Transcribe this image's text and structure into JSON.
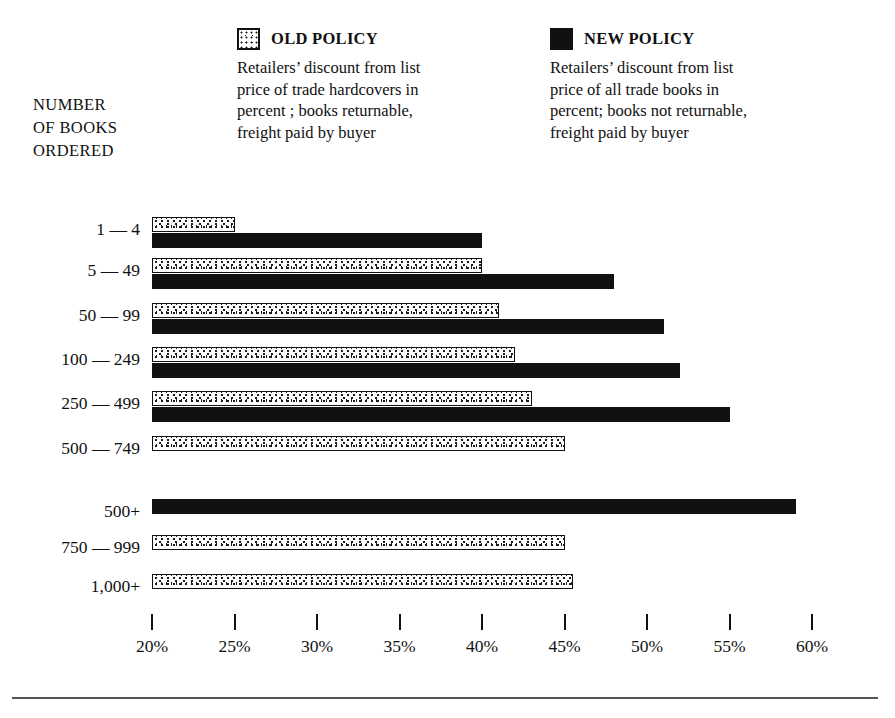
{
  "legend": {
    "old": {
      "swatch": "stipple-square-icon",
      "title": "OLD POLICY",
      "description": "Retailers’ discount from list price of trade hardcovers in percent ; books returnable, freight paid by buyer"
    },
    "new": {
      "swatch": "solid-black-square-icon",
      "title": "NEW POLICY",
      "description": "Retailers’ discount from list price of all trade books in percent; books not returnable, freight paid by buyer"
    }
  },
  "axis": {
    "y_caption_lines": [
      "NUMBER",
      "OF BOOKS",
      "ORDERED"
    ],
    "x_tick_labels": [
      "20%",
      "25%",
      "30%",
      "35%",
      "40%",
      "45%",
      "50%",
      "55%",
      "60%"
    ]
  },
  "colors": {
    "ink": "#111111",
    "paper": "#ffffff",
    "rule": "#555555"
  },
  "chart_data": {
    "type": "bar",
    "orientation": "horizontal",
    "title": "",
    "xlabel": "",
    "ylabel": "NUMBER OF BOOKS ORDERED",
    "xlim": [
      20,
      60
    ],
    "xticks": [
      20,
      25,
      30,
      35,
      40,
      45,
      50,
      55,
      60
    ],
    "grid": false,
    "legend_position": "top",
    "categories": [
      "1 —  4",
      "5 — 49",
      "50 — 99",
      "100 — 249",
      "250 — 499",
      "500 — 749",
      "500+",
      "750 — 999",
      "1,000+"
    ],
    "series": [
      {
        "name": "OLD POLICY",
        "values": [
          25,
          40,
          41,
          42,
          43,
          45,
          null,
          45,
          45.5
        ]
      },
      {
        "name": "NEW POLICY",
        "values": [
          40,
          48,
          51,
          52,
          55,
          null,
          59,
          null,
          null
        ]
      }
    ],
    "groups": [
      {
        "name": "paired-rows",
        "categories": [
          "1 —  4",
          "5 — 49",
          "50 — 99",
          "100 — 249",
          "250 — 499",
          "500 — 749"
        ]
      },
      {
        "name": "single-rows",
        "categories": [
          "500+",
          "750 — 999",
          "1,000+"
        ]
      }
    ]
  },
  "rows": [
    {
      "label": "1 —  4",
      "old": 25,
      "new": 40,
      "label_y": 221,
      "old_y": 217,
      "new_y": 233
    },
    {
      "label": "5 — 49",
      "old": 40,
      "new": 48,
      "label_y": 262,
      "old_y": 258,
      "new_y": 274
    },
    {
      "label": "50 — 99",
      "old": 41,
      "new": 51,
      "label_y": 307,
      "old_y": 303,
      "new_y": 319
    },
    {
      "label": "100 — 249",
      "old": 42,
      "new": 52,
      "label_y": 351,
      "old_y": 347,
      "new_y": 363
    },
    {
      "label": "250 — 499",
      "old": 43,
      "new": 55,
      "label_y": 395,
      "old_y": 391,
      "new_y": 407
    },
    {
      "label": "500 — 749",
      "old": 45,
      "new": null,
      "label_y": 440,
      "old_y": 436,
      "new_y": null
    },
    {
      "label": "500+",
      "old": null,
      "new": 59,
      "label_y": 503,
      "old_y": null,
      "new_y": 499
    },
    {
      "label": "750 — 999",
      "old": 45,
      "new": null,
      "label_y": 539,
      "old_y": 535,
      "new_y": null
    },
    {
      "label": "1,000+",
      "old": 45.5,
      "new": null,
      "label_y": 578,
      "old_y": 574,
      "new_y": null
    }
  ]
}
